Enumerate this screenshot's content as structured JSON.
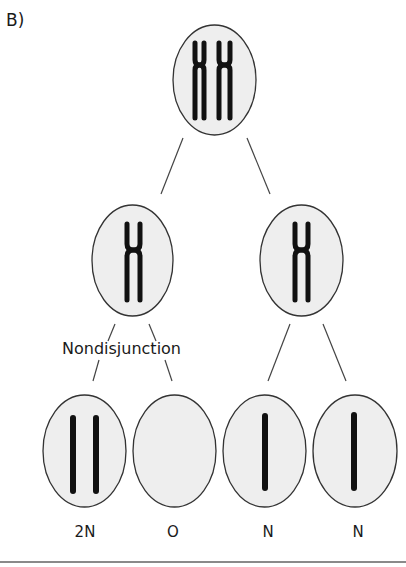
{
  "panel_label": "B)",
  "annotation": "Nondisjunction",
  "colors": {
    "cell_fill": "#eeeeee",
    "cell_stroke": "#333333",
    "chromosome": "#111111",
    "line": "#444444",
    "rule": "#8a8a8a"
  },
  "cells": {
    "parent": {
      "chromosomes": "XX",
      "description": "diploid cell with two replicated chromosomes"
    },
    "meiosis1": [
      {
        "id": "left",
        "chromosomes": "X"
      },
      {
        "id": "right",
        "chromosomes": "X"
      }
    ],
    "gametes": [
      {
        "label": "2N",
        "chromatids": 2
      },
      {
        "label": "O",
        "chromatids": 0
      },
      {
        "label": "N",
        "chromatids": 1
      },
      {
        "label": "N",
        "chromatids": 1
      }
    ]
  }
}
